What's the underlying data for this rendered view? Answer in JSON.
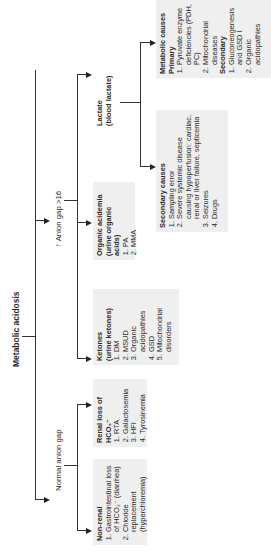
{
  "diagram": {
    "root": "Metabolic acidosis",
    "branches": {
      "normal": "Normal anion gap",
      "high": "↑ Anion gap >16"
    },
    "non_renal": {
      "title": "Non-renal",
      "items": [
        "Gastrointestinal loss of HCO₃⁻ (diarrhea)",
        "Chloride replacement (hyperchloremia)"
      ]
    },
    "renal": {
      "title": "Renal loss of HCO₃⁻",
      "items": [
        "RTA",
        "Galactosemia",
        "HFI",
        "Tyrosinemia"
      ]
    },
    "ketones": {
      "title": "Ketones",
      "subtitle": "(urine ketones)",
      "items": [
        "DM",
        "MSUD",
        "Organic acidopathies",
        "GSD",
        "Mitochondrial disorders"
      ]
    },
    "organic": {
      "title": "Organic acidemia",
      "subtitle": "(urine organic acids)",
      "items": [
        "PA",
        "MMA"
      ]
    },
    "lactate": {
      "title": "Lactate",
      "subtitle": "(blood lactate)"
    },
    "secondary_causes": {
      "title": "Secondary causes",
      "items": [
        "Sampling error",
        "Severe systemic disease causing hypoperfusion: cardiac, renal or liver failure, septicemia",
        "Seizures",
        "Drugs"
      ]
    },
    "metabolic_causes": {
      "title": "Metabolic causes",
      "primary_label": "Primary",
      "primary_items": [
        "Pyruvate enzyme deficiencies (PDH, PC)",
        "Mitochondrial diseases"
      ],
      "secondary_label": "Secondary",
      "secondary_items": [
        "Gluconeogenesis and GSD I",
        "Organic acidopathies"
      ]
    }
  }
}
